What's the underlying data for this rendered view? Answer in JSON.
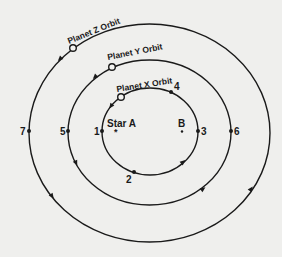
{
  "diagram": {
    "type": "orbital-diagram",
    "background": "#efefed",
    "line_color": "#1a1a1a",
    "stars": [
      {
        "id": "star-a",
        "label": "Star A",
        "x": 117,
        "y": 131
      },
      {
        "id": "star-b",
        "label": "B",
        "x": 182,
        "y": 131
      }
    ],
    "orbits": [
      {
        "id": "planet-x-orbit",
        "label": "Planet X Orbit",
        "cx": 150,
        "cy": 131.5,
        "rx": 48,
        "ry": 43.5,
        "direction": "counterclockwise"
      },
      {
        "id": "planet-y-orbit",
        "label": "Planet Y Orbit",
        "cx": 149.5,
        "cy": 132.5,
        "rx": 81.5,
        "ry": 72.5,
        "direction": "counterclockwise"
      },
      {
        "id": "planet-z-orbit",
        "label": "Planet Z Orbit",
        "cx": 149.5,
        "cy": 133,
        "rx": 120.5,
        "ry": 109,
        "direction": "counterclockwise"
      }
    ],
    "planets": [
      {
        "id": "planet-x",
        "orbit": "planet-x-orbit",
        "x": 121,
        "y": 97
      },
      {
        "id": "planet-y",
        "orbit": "planet-y-orbit",
        "x": 112,
        "y": 67
      },
      {
        "id": "planet-z",
        "orbit": "planet-z-orbit",
        "x": 73,
        "y": 48
      }
    ],
    "points": [
      {
        "label": "1",
        "x": 102,
        "y": 131
      },
      {
        "label": "2",
        "x": 134,
        "y": 172
      },
      {
        "label": "3",
        "x": 198,
        "y": 131
      },
      {
        "label": "4",
        "x": 171,
        "y": 92
      },
      {
        "label": "5",
        "x": 68,
        "y": 131
      },
      {
        "label": "6",
        "x": 231,
        "y": 131
      },
      {
        "label": "7",
        "x": 29,
        "y": 131
      }
    ]
  },
  "labels": {
    "star_a": "Star A",
    "star_b": "B",
    "orbit_x": "Planet X Orbit",
    "orbit_y": "Planet Y Orbit",
    "orbit_z": "Planet Z Orbit",
    "p1": "1",
    "p2": "2",
    "p3": "3",
    "p4": "4",
    "p5": "5",
    "p6": "6",
    "p7": "7"
  }
}
